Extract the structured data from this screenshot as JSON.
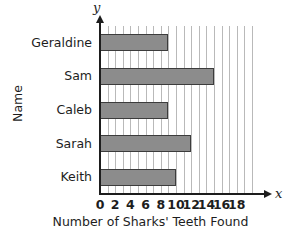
{
  "top_sliver_text": "",
  "chart_data": {
    "type": "bar",
    "orientation": "horizontal",
    "title": "",
    "xlabel": "Number of Sharks' Teeth Found",
    "ylabel": "Name",
    "categories": [
      "Geraldine",
      "Sam",
      "Caleb",
      "Sarah",
      "Keith"
    ],
    "values": [
      9,
      15,
      9,
      12,
      10
    ],
    "xlim": [
      0,
      20
    ],
    "xticks": [
      0,
      2,
      4,
      6,
      8,
      10,
      12,
      14,
      16,
      18
    ],
    "xtick_labels": [
      "0",
      "2",
      "4",
      "6",
      "8",
      "10",
      "12",
      "14",
      "16",
      "18"
    ],
    "gridline_interval": 1,
    "grid": true,
    "legend": null,
    "axis_arrow_labels": {
      "x": "x",
      "y": "y"
    },
    "colors": {
      "bar_fill": "#8c8c8c",
      "bar_stroke": "#3c3c3c",
      "gridline": "#b9b9b9",
      "axis": "#1d1d1d",
      "background": "#ffffff",
      "text": "#1d1d1d"
    }
  }
}
